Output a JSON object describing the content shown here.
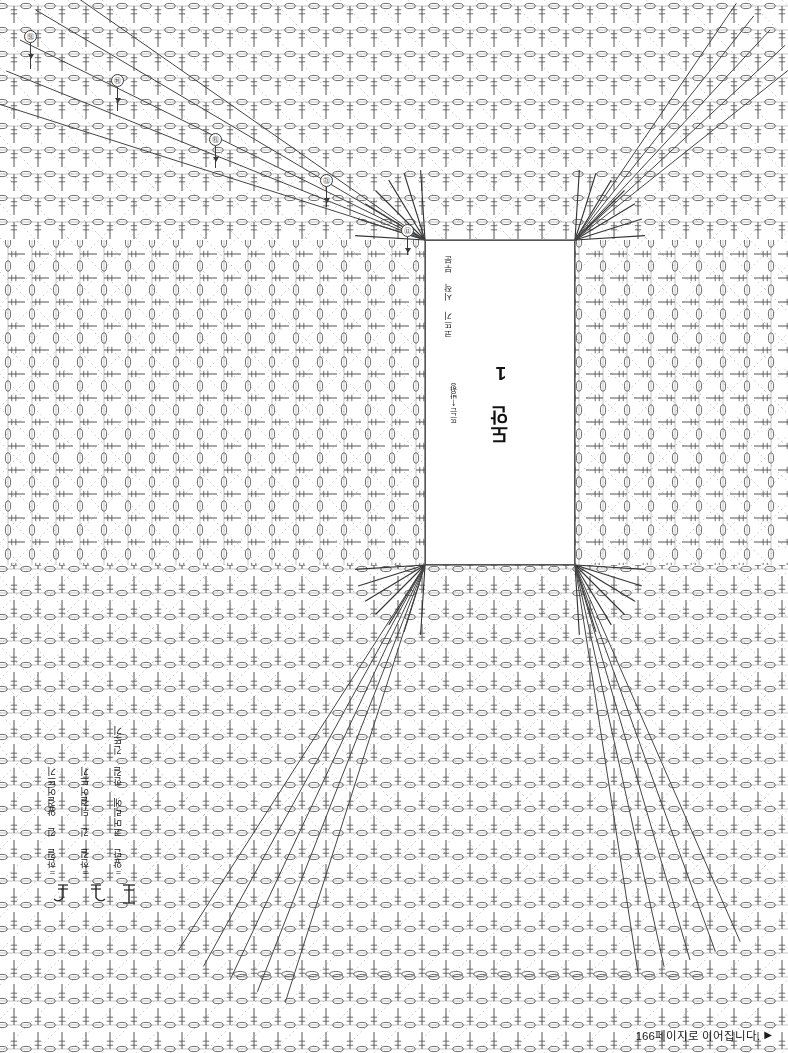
{
  "document": {
    "type": "crochet-pattern-chart",
    "language": "ko",
    "background_color": "#ffffff",
    "line_color": "#555555",
    "guide_line_color": "#bbbbbb"
  },
  "center_panel": {
    "title": "도안 1",
    "start_note": "코뜨기 시작 부분",
    "direction_note": "뜨는 방향",
    "direction_arrow": "↑",
    "border_color": "#555555"
  },
  "callouts": [
    {
      "id": "c15",
      "label": "⑮",
      "x": 24,
      "y": 30,
      "tail_height": 26
    },
    {
      "id": "c14",
      "label": "⑭",
      "x": 111,
      "y": 74,
      "tail_height": 24
    },
    {
      "id": "c13",
      "label": "⑬",
      "x": 209,
      "y": 133,
      "tail_height": 22
    },
    {
      "id": "c12",
      "label": "⑫",
      "x": 320,
      "y": 174,
      "tail_height": 20
    },
    {
      "id": "c11",
      "label": "⑪",
      "x": 401,
      "y": 224,
      "tail_height": 18
    }
  ],
  "legend": {
    "items": [
      {
        "symbol": "long-double-crochet-front-post",
        "label": "=한길 긴 앞걸어뜨기"
      },
      {
        "symbol": "long-double-crochet-back-post",
        "label": "=한길 긴 뒤걸어뜨기"
      },
      {
        "symbol": "front-post-cluster-2tog",
        "label": "=앞단 코머리에 한길 긴뜨기"
      }
    ]
  },
  "footer": {
    "text": "166페이지로 이어집니다.",
    "arrow": "▶"
  },
  "chart_data": {
    "type": "diagram",
    "title": "도안 1",
    "grid": {
      "row_spacing_px": 24,
      "col_spacing_px": 24,
      "stitch_bar_height_px": 17,
      "chain_oval_rx": 5.2,
      "chain_oval_ry": 2.6
    },
    "fields": [
      {
        "name": "top-field",
        "orientation": "down",
        "rows": 9,
        "corner": "top"
      },
      {
        "name": "right-field",
        "orientation": "left",
        "rows": 14,
        "corner": "right"
      },
      {
        "name": "bottom-field",
        "orientation": "up",
        "rows": 18,
        "corner": "bottom"
      },
      {
        "name": "left-field",
        "orientation": "right",
        "rows": 14,
        "corner": "left"
      }
    ],
    "guide_lines": {
      "style": "dotted",
      "count": 36,
      "color": "#bbbbbb"
    }
  }
}
